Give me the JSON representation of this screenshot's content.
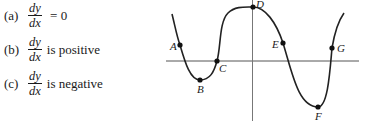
{
  "questions": [
    {
      "label": "(a)",
      "numerator": "dy",
      "denominator": "dx",
      "rest": " = 0"
    },
    {
      "label": "(b)",
      "numerator": "dy",
      "denominator": "dx",
      "rest": "is positive"
    },
    {
      "label": "(c)",
      "numerator": "dy",
      "denominator": "dx",
      "rest": "is negative"
    }
  ],
  "graph": {
    "axis_color": "#555555",
    "curve_color": "#222222",
    "points": [
      {
        "name": "A",
        "x": 180,
        "y": 45
      },
      {
        "name": "B",
        "x": 200,
        "y": 80
      },
      {
        "name": "C",
        "x": 217,
        "y": 61
      },
      {
        "name": "D",
        "x": 253,
        "y": 7
      },
      {
        "name": "E",
        "x": 283,
        "y": 43
      },
      {
        "name": "F",
        "x": 318,
        "y": 107
      },
      {
        "name": "G",
        "x": 332,
        "y": 48
      }
    ]
  }
}
